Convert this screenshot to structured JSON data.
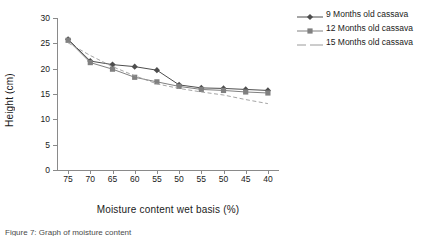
{
  "chart_data": {
    "type": "line",
    "title": "",
    "xlabel": "Moisture content wet basis (%)",
    "ylabel": "Height (cm)",
    "categories": [
      "75",
      "70",
      "65",
      "60",
      "55",
      "50",
      "55",
      "50",
      "45",
      "40"
    ],
    "ylim": [
      0,
      30
    ],
    "yticks": [
      "0",
      "5",
      "10",
      "15",
      "20",
      "25",
      "30"
    ],
    "grid": false,
    "legend_position": "right",
    "series": [
      {
        "name": "9 Months old cassava",
        "marker": "diamond",
        "line_style": "solid",
        "color": "#4d4d4d",
        "values": [
          25.8,
          21.5,
          20.8,
          20.4,
          19.7,
          16.8,
          16.2,
          16.1,
          15.9,
          15.7
        ]
      },
      {
        "name": "12 Months old cassava",
        "marker": "square",
        "line_style": "solid",
        "color": "#808080",
        "values": [
          25.6,
          21.2,
          19.9,
          18.3,
          17.4,
          16.5,
          15.9,
          15.7,
          15.4,
          15.2
        ]
      },
      {
        "name": "15 Months old cassava",
        "marker": "none",
        "line_style": "dashed",
        "color": "#9a9a9a",
        "values": [
          25.1,
          22.6,
          20.4,
          18.6,
          17.0,
          16.1,
          15.4,
          14.8,
          13.9,
          13.1
        ]
      }
    ]
  },
  "legend": {
    "items": [
      {
        "label": "9 Months old cassava"
      },
      {
        "label": "12 Months old cassava"
      },
      {
        "label": "15 Months old cassava"
      }
    ]
  },
  "caption": {
    "text": "Figure 7: Graph of moisture content"
  }
}
